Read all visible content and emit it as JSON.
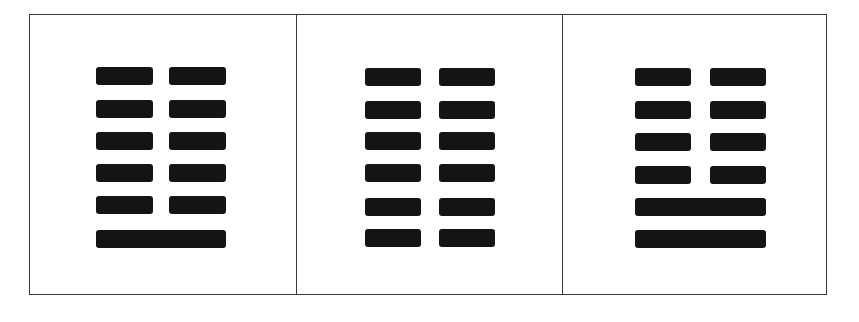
{
  "figure": {
    "type": "hexagram-panels",
    "line_color": "#141414",
    "border_color": "#3a3a3a",
    "background": "#ffffff",
    "panels": [
      {
        "name": "hexagram-panel-1",
        "lines_top_to_bottom": [
          "yin",
          "yin",
          "yin",
          "yin",
          "yin",
          "yang"
        ],
        "row_y": [
          66,
          99,
          131,
          163,
          195,
          229
        ],
        "left_x": 95,
        "split_x": 168,
        "half_width": 57,
        "full_width": 130
      },
      {
        "name": "hexagram-panel-2",
        "lines_top_to_bottom": [
          "yin",
          "yin",
          "yin",
          "yin",
          "yin",
          "yin"
        ],
        "row_y": [
          67,
          100,
          131,
          163,
          197,
          228
        ],
        "left_x": 363,
        "split_x": 437,
        "half_width": 56,
        "full_width": 130
      },
      {
        "name": "hexagram-panel-3",
        "lines_top_to_bottom": [
          "yin",
          "yin",
          "yin",
          "yin",
          "yang",
          "yang"
        ],
        "row_y": [
          67,
          100,
          132,
          165,
          197,
          229
        ],
        "left_x": 633,
        "split_x": 708,
        "half_width": 56,
        "full_width": 131
      }
    ],
    "dividers_x": [
      295,
      561
    ]
  }
}
